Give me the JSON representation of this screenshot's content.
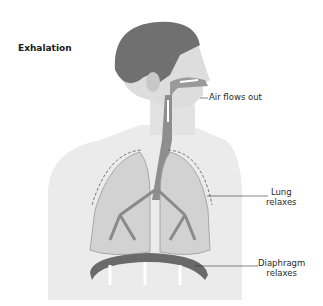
{
  "title": "Exhalation",
  "labels": {
    "air": "Air flows out",
    "lung_line1": "Lung",
    "lung_line2": "relaxes",
    "diaphragm_line1": "Diaphragm",
    "diaphragm_line2": "relaxes"
  },
  "colors": {
    "hair": "#6e6e6e",
    "skin": "#dcdcdc",
    "torso": "#e8e8e8",
    "lung": "#cfcfcf",
    "bronchi": "#8a8a8a",
    "diaphragm": "#6a6a6a"
  }
}
